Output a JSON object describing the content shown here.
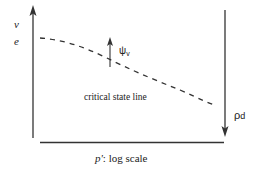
{
  "diagram": {
    "y_axis_labels": {
      "top": "v",
      "bottom": "e"
    },
    "x_axis_label": {
      "symbol": "p'",
      "text": ": log scale"
    },
    "curve_label": "critical state line",
    "psi_label": {
      "symbol": "ψ",
      "subscript": "v"
    },
    "rho_label": {
      "symbol": "ρ",
      "subscript": "d"
    },
    "colors": {
      "line": "#333333",
      "text": "#222222",
      "background": "#ffffff"
    }
  }
}
